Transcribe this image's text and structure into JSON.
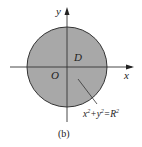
{
  "figure": {
    "caption": "(b)",
    "axis_x_label": "x",
    "axis_y_label": "y",
    "origin_label": "O",
    "region_label": "D",
    "equation": {
      "base": "x",
      "sup1": "2",
      "plus": "+y",
      "sup2": "2",
      "eq": "=R",
      "sup3": "2"
    },
    "colors": {
      "region_fill": "#a8a8a8",
      "stroke": "#333333"
    }
  }
}
